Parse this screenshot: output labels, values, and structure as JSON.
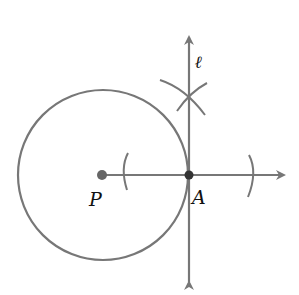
{
  "diagram": {
    "labels": {
      "center": "P",
      "point_of_tangency": "A",
      "line": "ℓ"
    },
    "colors": {
      "stroke": "#777777",
      "point": "#555555",
      "text": "#111111"
    }
  }
}
